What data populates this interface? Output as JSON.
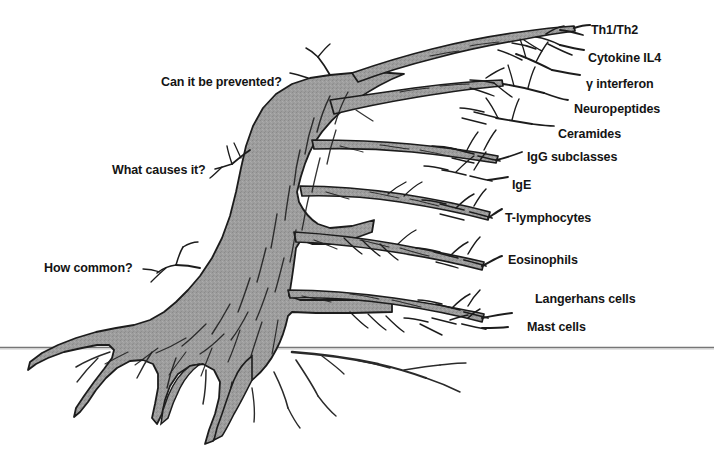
{
  "figure": {
    "background_color": "#ffffff",
    "trunk_fill_color": "#9a9a9a",
    "outline_color": "#1a1a1a",
    "ground_line_color": "#6e6e6e"
  },
  "left_labels": [
    {
      "text": "Can it be prevented?",
      "bold": true,
      "x": 161,
      "y": 75
    },
    {
      "text": "What causes it?",
      "bold": false,
      "x": 112,
      "y": 163
    },
    {
      "text": "How common?",
      "bold": false,
      "x": 44,
      "y": 261
    }
  ],
  "right_labels": [
    {
      "text": "Th1/Th2",
      "x": 591,
      "y": 23
    },
    {
      "text": "Cytokine IL4",
      "x": 588,
      "y": 51
    },
    {
      "text": "γ interferon",
      "x": 586,
      "y": 77
    },
    {
      "text": "Neuropeptides",
      "x": 574,
      "y": 102
    },
    {
      "text": "Ceramides",
      "x": 558,
      "y": 127
    },
    {
      "text": "IgG subclasses",
      "x": 527,
      "y": 150
    },
    {
      "text": "IgE",
      "x": 512,
      "y": 178
    },
    {
      "text": "T-lymphocytes",
      "x": 505,
      "y": 211
    },
    {
      "text": "Eosinophils",
      "x": 508,
      "y": 253
    },
    {
      "text": "Langerhans cells",
      "x": 535,
      "y": 292
    },
    {
      "text": "Mast cells",
      "x": 527,
      "y": 320
    }
  ],
  "ground_line": {
    "name": "ground-line",
    "y": 347,
    "x_start": 0,
    "x_end": 714
  }
}
